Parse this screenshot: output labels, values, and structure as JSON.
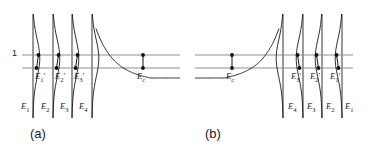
{
  "figure": {
    "type": "diagram",
    "width": 374,
    "height": 166,
    "colors": {
      "curve": "#1a1a1a",
      "asymptote": "#8f8f8f",
      "horizontal_line": "#8f8f8f",
      "marker": "#111111",
      "text": "#1a1a1a",
      "background": "#ffffff"
    },
    "axis_labels": {
      "unity": "1"
    },
    "panels": [
      {
        "id": "a",
        "label": "(a)",
        "label_x": 30,
        "label_y": 134,
        "orientation": "left",
        "x_range": [
          22,
          180
        ],
        "asymptotes": [
          33,
          53,
          72,
          92
        ],
        "horizontal_lines": [
          {
            "name": "unity-line",
            "y": 55,
            "x1": 22,
            "x2": 180
          },
          {
            "name": "lower-line",
            "y": 68,
            "x1": 22,
            "x2": 180
          }
        ],
        "branches": [
          {
            "asymptote_x": 33,
            "label_top": "E",
            "sub_top": "1",
            "prime": true,
            "label_top_x": 35,
            "label_top_y": 71,
            "marker_upper": {
              "x": 38.5,
              "y": 55
            },
            "marker_lower": {
              "x": 36.5,
              "y": 68
            }
          },
          {
            "asymptote_x": 53,
            "label_top": "E",
            "sub_top": "2",
            "prime": true,
            "label_top_x": 55,
            "label_top_y": 71,
            "marker_upper": {
              "x": 58.5,
              "y": 55
            },
            "marker_lower": {
              "x": 56.5,
              "y": 68
            }
          },
          {
            "asymptote_x": 72,
            "label_top": "E",
            "sub_top": "3",
            "prime": true,
            "label_top_x": 74,
            "label_top_y": 71,
            "marker_upper": {
              "x": 77.5,
              "y": 55
            },
            "marker_lower": {
              "x": 75.5,
              "y": 68
            }
          },
          {
            "asymptote_x": 92,
            "label_top": "E",
            "sub_top": "c",
            "prime": false,
            "label_top_x": 137,
            "label_top_y": 71,
            "marker_upper": {
              "x": 143,
              "y": 55
            },
            "marker_lower": {
              "x": 143,
              "y": 68
            }
          }
        ],
        "bottom_labels": [
          {
            "text": "E",
            "sub": "1",
            "x": 21,
            "y": 101
          },
          {
            "text": "E",
            "sub": "2",
            "x": 41,
            "y": 101
          },
          {
            "text": "E",
            "sub": "3",
            "x": 60,
            "y": 101
          },
          {
            "text": "E",
            "sub": "4",
            "x": 79,
            "y": 101
          }
        ]
      },
      {
        "id": "b",
        "label": "(b)",
        "label_x": 205,
        "label_y": 134,
        "orientation": "right",
        "x_range": [
          195,
          353
        ],
        "asymptotes": [
          283,
          303,
          322,
          342
        ],
        "horizontal_lines": [
          {
            "name": "unity-line",
            "y": 55,
            "x1": 195,
            "x2": 353
          },
          {
            "name": "lower-line",
            "y": 68,
            "x1": 195,
            "x2": 353
          }
        ],
        "branches": [
          {
            "asymptote_x": 342,
            "label_top": "E",
            "sub_top": "1",
            "prime": true,
            "label_top_x": 330,
            "label_top_y": 71,
            "marker_upper": {
              "x": 336.5,
              "y": 55
            },
            "marker_lower": {
              "x": 338.5,
              "y": 68
            }
          },
          {
            "asymptote_x": 322,
            "label_top": "E",
            "sub_top": "2",
            "prime": true,
            "label_top_x": 310,
            "label_top_y": 71,
            "marker_upper": {
              "x": 316.5,
              "y": 55
            },
            "marker_lower": {
              "x": 318.5,
              "y": 68
            }
          },
          {
            "asymptote_x": 303,
            "label_top": "E",
            "sub_top": "3",
            "prime": true,
            "label_top_x": 291,
            "label_top_y": 71,
            "marker_upper": {
              "x": 297.5,
              "y": 55
            },
            "marker_lower": {
              "x": 299.5,
              "y": 68
            }
          },
          {
            "asymptote_x": 283,
            "label_top": "E",
            "sub_top": "c",
            "prime": false,
            "label_top_x": 226,
            "label_top_y": 71,
            "marker_upper": {
              "x": 232,
              "y": 55
            },
            "marker_lower": {
              "x": 232,
              "y": 68
            }
          }
        ],
        "bottom_labels": [
          {
            "text": "E",
            "sub": "4",
            "x": 288,
            "y": 101
          },
          {
            "text": "E",
            "sub": "3",
            "x": 307,
            "y": 101
          },
          {
            "text": "E",
            "sub": "2",
            "x": 326,
            "y": 101
          },
          {
            "text": "E",
            "sub": "1",
            "x": 345,
            "y": 101
          }
        ]
      }
    ]
  }
}
